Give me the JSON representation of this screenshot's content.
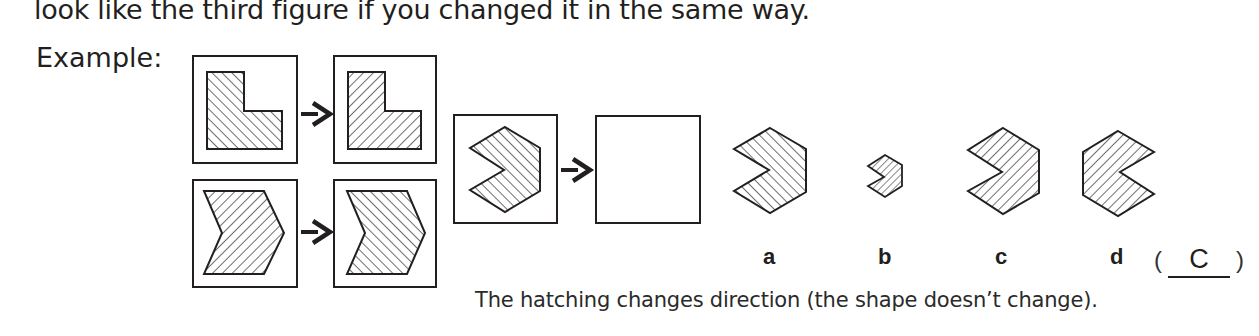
{
  "instruction_text": "look like the third figure if you changed it in the same way.",
  "example_label": "Example:",
  "example_pairs": [
    {
      "shape": "L-shape",
      "from_hatch": "forward-diagonal",
      "to_hatch": "backward-diagonal"
    },
    {
      "shape": "chevron",
      "from_hatch": "backward-diagonal",
      "to_hatch": "forward-diagonal"
    }
  ],
  "question": {
    "shape": "notched-hexagon",
    "hatch": "forward-diagonal",
    "target": "empty-box"
  },
  "options": [
    {
      "label": "a",
      "description": "same shape, same hatching"
    },
    {
      "label": "b",
      "description": "smaller shape, backward hatching"
    },
    {
      "label": "c",
      "description": "same shape, backward hatching"
    },
    {
      "label": "d",
      "description": "mirrored shape, backward hatching"
    }
  ],
  "answer": {
    "open_paren": "(",
    "value": "C",
    "close_paren": ")"
  },
  "caption": "The hatching changes direction (the shape doesn’t change).",
  "colors": {
    "ink": "#231f20",
    "background": "#ffffff"
  },
  "icons": {
    "arrow": "right-arrow-icon"
  }
}
